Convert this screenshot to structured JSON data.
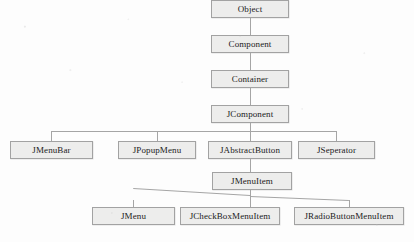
{
  "figure": {
    "type": "class-inheritance-tree",
    "background_color": "#fdfdfd",
    "node_fill_color": "#ededec",
    "node_border_color": "#a2a2a2",
    "connector_color": "#a5a5a5",
    "text_color": "#1b1b1b"
  },
  "nodes": {
    "object": {
      "label": "Object",
      "level": 1
    },
    "component": {
      "label": "Component",
      "level": 2
    },
    "container": {
      "label": "Container",
      "level": 3
    },
    "jcomponent": {
      "label": "JComponent",
      "level": 4
    },
    "jmenubar": {
      "label": "JMenuBar",
      "level": 5
    },
    "jpopupmenu": {
      "label": "JPopupMenu",
      "level": 5
    },
    "jabstractbutton": {
      "label": "JAbstractButton",
      "level": 5
    },
    "jseperator": {
      "label": "JSeperator",
      "level": 5
    },
    "jmenuitem": {
      "label": "JMenuItem",
      "level": 6
    },
    "jmenu": {
      "label": "JMenu",
      "level": 7
    },
    "jcheckboxmenuitem": {
      "label": "JCheckBoxMenuItem",
      "level": 7
    },
    "jradiobuttonmenuitem": {
      "label": "JRadioButtonMenuItem",
      "level": 7
    }
  },
  "edges": [
    {
      "from": "Object",
      "to": "Component",
      "style": "orthogonal"
    },
    {
      "from": "Component",
      "to": "Container",
      "style": "orthogonal"
    },
    {
      "from": "Container",
      "to": "JComponent",
      "style": "orthogonal"
    },
    {
      "from": "JComponent",
      "to": "JMenuBar",
      "style": "orthogonal"
    },
    {
      "from": "JComponent",
      "to": "JPopupMenu",
      "style": "orthogonal"
    },
    {
      "from": "JComponent",
      "to": "JAbstractButton",
      "style": "orthogonal"
    },
    {
      "from": "JComponent",
      "to": "JSeperator",
      "style": "orthogonal"
    },
    {
      "from": "JAbstractButton",
      "to": "JMenuItem",
      "style": "orthogonal"
    },
    {
      "from": "JMenuItem",
      "to": "JMenu",
      "style": "angled"
    },
    {
      "from": "JMenuItem",
      "to": "JCheckBoxMenuItem",
      "style": "angled"
    },
    {
      "from": "JMenuItem",
      "to": "JRadioButtonMenuItem",
      "style": "angled"
    }
  ]
}
